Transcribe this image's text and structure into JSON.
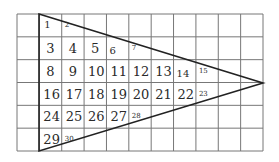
{
  "diagram": {
    "type": "grid-with-triangle",
    "grid": {
      "columns": 11,
      "rows": 6,
      "left": 17,
      "top": 14,
      "right": 263,
      "bottom": 151,
      "line_color": "#777777"
    },
    "triangle": {
      "vertices": [
        [
          39,
          14
        ],
        [
          263,
          83
        ],
        [
          39,
          151
        ]
      ],
      "stroke_color": "#222222"
    },
    "cells": [
      {
        "label": "1",
        "row": 0,
        "col": 1,
        "size": "small-big"
      },
      {
        "label": "2",
        "row": 0,
        "col": 2,
        "size": "small"
      },
      {
        "label": "3",
        "row": 1,
        "col": 1,
        "size": "big"
      },
      {
        "label": "4",
        "row": 1,
        "col": 2,
        "size": "big"
      },
      {
        "label": "5",
        "row": 1,
        "col": 3,
        "size": "big"
      },
      {
        "label": "6",
        "row": 1,
        "col": 4,
        "size": "mid"
      },
      {
        "label": "7",
        "row": 1,
        "col": 5,
        "size": "small"
      },
      {
        "label": "8",
        "row": 2,
        "col": 1,
        "size": "big"
      },
      {
        "label": "9",
        "row": 2,
        "col": 2,
        "size": "big"
      },
      {
        "label": "10",
        "row": 2,
        "col": 3,
        "size": "big"
      },
      {
        "label": "11",
        "row": 2,
        "col": 4,
        "size": "big"
      },
      {
        "label": "12",
        "row": 2,
        "col": 5,
        "size": "big"
      },
      {
        "label": "13",
        "row": 2,
        "col": 6,
        "size": "big"
      },
      {
        "label": "14",
        "row": 2,
        "col": 7,
        "size": "mid"
      },
      {
        "label": "15",
        "row": 2,
        "col": 8,
        "size": "small"
      },
      {
        "label": "16",
        "row": 3,
        "col": 1,
        "size": "big"
      },
      {
        "label": "17",
        "row": 3,
        "col": 2,
        "size": "big"
      },
      {
        "label": "18",
        "row": 3,
        "col": 3,
        "size": "big"
      },
      {
        "label": "19",
        "row": 3,
        "col": 4,
        "size": "big"
      },
      {
        "label": "20",
        "row": 3,
        "col": 5,
        "size": "big"
      },
      {
        "label": "21",
        "row": 3,
        "col": 6,
        "size": "big"
      },
      {
        "label": "22",
        "row": 3,
        "col": 7,
        "size": "big"
      },
      {
        "label": "23",
        "row": 3,
        "col": 8,
        "size": "small"
      },
      {
        "label": "24",
        "row": 4,
        "col": 1,
        "size": "big"
      },
      {
        "label": "25",
        "row": 4,
        "col": 2,
        "size": "big"
      },
      {
        "label": "26",
        "row": 4,
        "col": 3,
        "size": "big"
      },
      {
        "label": "27",
        "row": 4,
        "col": 4,
        "size": "big"
      },
      {
        "label": "28",
        "row": 4,
        "col": 5,
        "size": "small"
      },
      {
        "label": "29",
        "row": 5,
        "col": 1,
        "size": "big"
      },
      {
        "label": "30",
        "row": 5,
        "col": 2,
        "size": "small"
      }
    ]
  }
}
